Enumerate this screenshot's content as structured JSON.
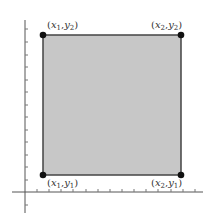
{
  "diagram": {
    "title": "",
    "colors": {
      "fill": "#c7c7c7",
      "edge": "#444444",
      "point": "#111111",
      "axis": "#555555",
      "tick": "#777777"
    },
    "points": [
      {
        "id": "x1y2",
        "label_x": "x",
        "sub_x": "1",
        "label_y": "y",
        "sub_y": "2",
        "px": 43,
        "py": 35
      },
      {
        "id": "x2y2",
        "label_x": "x",
        "sub_x": "2",
        "label_y": "y",
        "sub_y": "2",
        "px": 181,
        "py": 35
      },
      {
        "id": "x1y1",
        "label_x": "x",
        "sub_x": "1",
        "label_y": "y",
        "sub_y": "1",
        "px": 43,
        "py": 175
      },
      {
        "id": "x2y1",
        "label_x": "x",
        "sub_x": "2",
        "label_y": "y",
        "sub_y": "1",
        "px": 181,
        "py": 175
      }
    ],
    "labels": {
      "x1y2": "(x1,y2)",
      "x2y2": "(x2,y2)",
      "x1y1": "(x1,y1)",
      "x2y1": "(x2,y1)"
    },
    "axes": {
      "x_axis": {
        "y": 192,
        "from": 12,
        "to": 203,
        "tick_spacing": 12
      },
      "y_axis": {
        "x": 25,
        "from": 20,
        "to": 213,
        "tick_spacing": 12.5
      }
    }
  }
}
